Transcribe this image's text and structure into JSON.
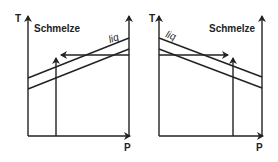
{
  "diagram": {
    "left_panel": {
      "y_axis_label": "T",
      "x_axis_label": "P",
      "region_label": "Schmelze",
      "line_label": "liq"
    },
    "right_panel": {
      "y_axis_label": "T",
      "x_axis_label": "P",
      "region_label": "Schmelze",
      "line_label": "liq"
    },
    "colors": {
      "stroke": "#222222",
      "background": "#ffffff"
    }
  }
}
